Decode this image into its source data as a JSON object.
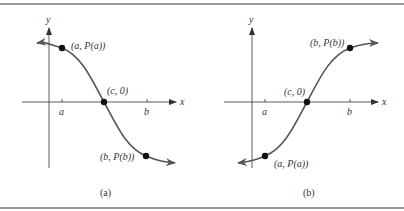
{
  "figure": {
    "panels": [
      {
        "id": "a",
        "caption": "(a)",
        "axis_x_label": "x",
        "axis_y_label": "y",
        "tick_a_label": "a",
        "tick_b_label": "b",
        "point_a_label": "(a, P(a))",
        "point_c_label": "(c, 0)",
        "point_b_label": "(b, P(b))",
        "description": "Decreasing curve crossing x-axis at (c, 0)"
      },
      {
        "id": "b",
        "caption": "(b)",
        "axis_x_label": "x",
        "axis_y_label": "y",
        "tick_a_label": "a",
        "tick_b_label": "b",
        "point_a_label": "(a, P(a))",
        "point_c_label": "(c, 0)",
        "point_b_label": "(b, P(b))",
        "description": "Increasing curve crossing x-axis at (c, 0)"
      }
    ],
    "colors": {
      "curve": "#555555",
      "axis": "#333333",
      "point": "#111111",
      "rule": "#9a9a9a"
    }
  }
}
